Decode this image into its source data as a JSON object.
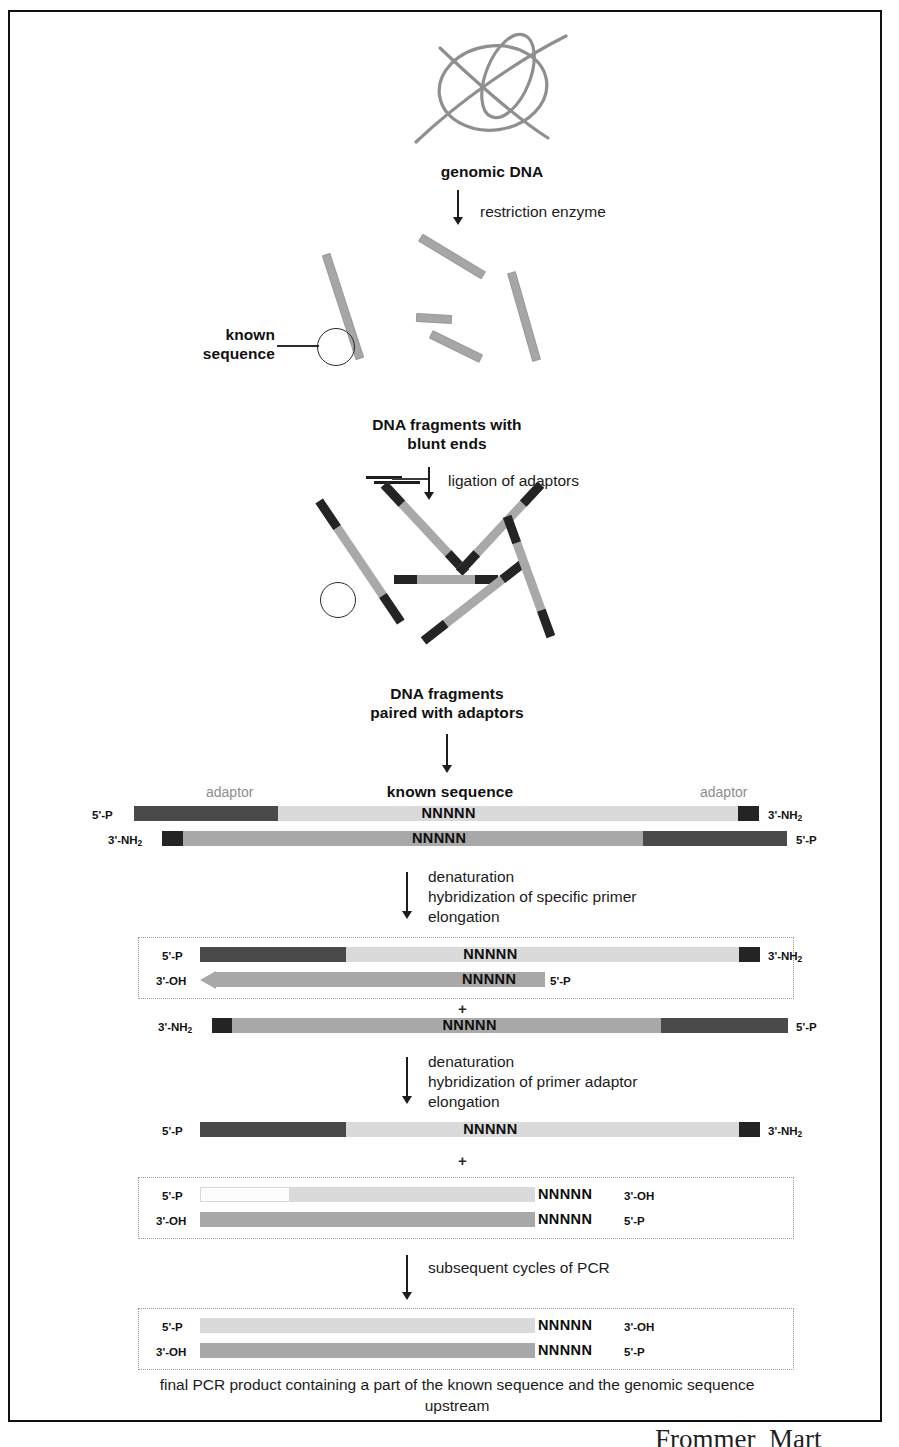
{
  "figure": {
    "type": "process-flow-diagram"
  },
  "steps": {
    "genomic_dna_label": "genomic DNA",
    "restriction_enzyme": "restriction enzyme",
    "known_sequence_callout": "known\nsequence",
    "blunt_ends_label": "DNA fragments with\nblunt ends",
    "ligation_of_adaptors": "ligation of adaptors",
    "paired_with_adaptors_label": "DNA fragments\npaired with adaptors",
    "denaturation_1": "denaturation\nhybridization of specific primer\nelongation",
    "denaturation_2": "denaturation\nhybridization of primer adaptor\nelongation",
    "subsequent_cycles": "subsequent cycles of PCR",
    "final_caption": "final PCR product containing a part of the known\nsequence and the genomic sequence upstream"
  },
  "duplex1": {
    "adaptor_left_label": "adaptor",
    "adaptor_right_label": "adaptor",
    "known_sequence_label": "known sequence",
    "top_left_end": "5'-P",
    "top_right_end": "3'-NH",
    "top_right_end_sub": "2",
    "bottom_left_end": "3'-NH",
    "bottom_left_end_sub": "2",
    "bottom_right_end": "5'-P",
    "top_marker": "NNNNN",
    "bottom_marker": "NNNNN"
  },
  "panel2": {
    "top_left_end": "5'-P",
    "top_right_end": "3'-NH",
    "top_right_end_sub": "2",
    "top_marker": "NNNNN",
    "bottom_left_end": "3'-OH",
    "bottom_marker": "NNNNN",
    "bottom_right_end": "5'-P",
    "plus": "+"
  },
  "panel3": {
    "left_end": "3'-NH",
    "left_end_sub": "2",
    "marker": "NNNNN",
    "right_end": "5'-P"
  },
  "panel4": {
    "left_end": "5'-P",
    "marker": "NNNNN",
    "right_end": "3'-NH",
    "right_end_sub": "2",
    "plus": "+"
  },
  "panel5": {
    "top_left_end": "5'-P",
    "top_marker": "NNNNN",
    "top_right_end": "3'-OH",
    "bottom_left_end": "3'-OH",
    "bottom_marker": "NNNNN",
    "bottom_right_end": "5'-P"
  },
  "panel6": {
    "top_left_end": "5'-P",
    "top_marker": "NNNNN",
    "top_right_end": "3'-OH",
    "bottom_left_end": "3'-OH",
    "bottom_marker": "NNNNN",
    "bottom_right_end": "5'-P"
  },
  "page_signature": "Frommer  Mart",
  "colors": {
    "adaptor_dark": "#242424",
    "strand_light_gray": "#dadada",
    "strand_mid_gray": "#a8a8a8",
    "adaptor_block": "#4a4a4a",
    "gray_text": "#8e8e8e",
    "ink": "#1a1a1a"
  }
}
